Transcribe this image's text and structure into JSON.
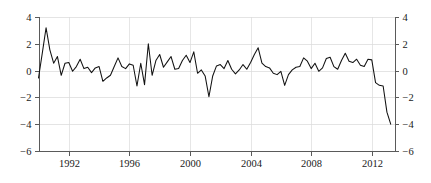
{
  "chart_data": {
    "type": "line",
    "title": "",
    "subtitle": "",
    "xlabel": "",
    "ylabel": "",
    "xlim": [
      1990.0,
      2013.5
    ],
    "ylim": [
      -6,
      4
    ],
    "grid": true,
    "legend": "none",
    "axes": {
      "left": {
        "ticks": [
          4,
          2,
          0,
          -2,
          -4,
          -6
        ],
        "tick_labels": [
          "4",
          "2",
          "0",
          "-2",
          "-4",
          "-6"
        ]
      },
      "right": {
        "ticks": [
          4,
          2,
          0,
          -2,
          -4,
          -6
        ],
        "tick_labels": [
          "4",
          "2",
          "0",
          "-2",
          "-4",
          "-6"
        ]
      },
      "bottom": {
        "ticks": [
          1992,
          1996,
          2000,
          2004,
          2008,
          2012
        ],
        "tick_labels": [
          "1992",
          "1996",
          "2000",
          "2004",
          "2008",
          "2012"
        ]
      }
    },
    "series": [
      {
        "name": "series-1",
        "color": "#111111",
        "x": [
          1990.0,
          1990.25,
          1990.5,
          1990.75,
          1991.0,
          1991.25,
          1991.5,
          1991.75,
          1992.0,
          1992.25,
          1992.5,
          1992.75,
          1993.0,
          1993.25,
          1993.5,
          1993.75,
          1994.0,
          1994.25,
          1994.5,
          1994.75,
          1995.0,
          1995.25,
          1995.5,
          1995.75,
          1996.0,
          1996.25,
          1996.5,
          1996.75,
          1997.0,
          1997.25,
          1997.5,
          1997.75,
          1998.0,
          1998.25,
          1998.5,
          1998.75,
          1999.0,
          1999.25,
          1999.5,
          1999.75,
          2000.0,
          2000.25,
          2000.5,
          2000.75,
          2001.0,
          2001.25,
          2001.5,
          2001.75,
          2002.0,
          2002.25,
          2002.5,
          2002.75,
          2003.0,
          2003.25,
          2003.5,
          2003.75,
          2004.0,
          2004.25,
          2004.5,
          2004.75,
          2005.0,
          2005.25,
          2005.5,
          2005.75,
          2006.0,
          2006.25,
          2006.5,
          2006.75,
          2007.0,
          2007.25,
          2007.5,
          2007.75,
          2008.0,
          2008.25,
          2008.5,
          2008.75,
          2009.0,
          2009.25,
          2009.5,
          2009.75,
          2010.0,
          2010.25,
          2010.5,
          2010.75,
          2011.0,
          2011.25,
          2011.5,
          2011.75,
          2012.0,
          2012.25,
          2012.5,
          2012.75,
          2013.0,
          2013.25
        ],
        "values": [
          -0.55,
          1.3,
          3.2,
          1.55,
          0.55,
          1.05,
          -0.35,
          0.55,
          0.6,
          -0.05,
          0.3,
          0.85,
          0.15,
          0.25,
          -0.15,
          0.2,
          0.3,
          -0.8,
          -0.55,
          -0.35,
          0.3,
          0.95,
          0.3,
          0.15,
          0.5,
          0.4,
          -1.15,
          0.55,
          -1.05,
          2.0,
          -0.35,
          0.75,
          1.2,
          0.25,
          0.65,
          1.05,
          0.1,
          0.15,
          0.75,
          1.15,
          0.6,
          1.4,
          -0.2,
          0.05,
          -0.4,
          -1.95,
          -0.4,
          0.35,
          0.45,
          0.15,
          0.75,
          0.1,
          -0.25,
          0.05,
          0.45,
          0.1,
          0.6,
          1.2,
          1.7,
          0.55,
          0.3,
          0.2,
          -0.2,
          -0.3,
          -0.05,
          -1.1,
          -0.3,
          0.05,
          0.25,
          0.3,
          0.95,
          0.7,
          0.15,
          0.55,
          -0.05,
          0.2,
          0.9,
          1.0,
          0.3,
          0.1,
          0.75,
          1.3,
          0.7,
          0.6,
          0.85,
          0.4,
          0.3,
          0.85,
          0.8,
          -0.9,
          -1.1,
          -1.15,
          -3.1,
          -4.0
        ]
      }
    ]
  }
}
